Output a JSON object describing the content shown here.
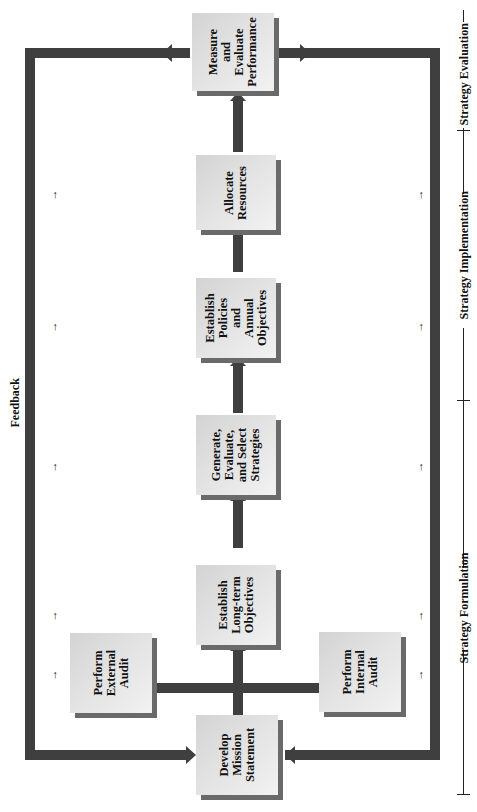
{
  "diagram": {
    "orientation": "rotated-90-ccw",
    "feedback_label": "Feedback",
    "boxes": [
      {
        "id": "develop-mission",
        "label": "Develop\nMission\nStatement"
      },
      {
        "id": "external-audit",
        "label": "Perform\nExternal\nAudit"
      },
      {
        "id": "internal-audit",
        "label": "Perform\nInternal\nAudit"
      },
      {
        "id": "long-term-objectives",
        "label": "Establish\nLong-term\nObjectives"
      },
      {
        "id": "generate-strategies",
        "label": "Generate,\nEvaluate,\nand Select\nStrategies"
      },
      {
        "id": "policies-objectives",
        "label": "Establish\nPolicies\nand\nAnnual\nObjectives"
      },
      {
        "id": "allocate-resources",
        "label": "Allocate\nResources"
      },
      {
        "id": "measure-performance",
        "label": "Measure\nand\nEvaluate\nPerformance"
      }
    ],
    "phases": [
      {
        "id": "formulation",
        "label": "Strategy Formulation"
      },
      {
        "id": "implementation",
        "label": "Strategy Implementation"
      },
      {
        "id": "evaluation",
        "label": "Strategy Evaluation"
      }
    ],
    "small_arrow_glyph": "→",
    "colors": {
      "connector": "#3f3f3f",
      "box_fill": "#e0e0e0",
      "box_shadow": "#6a6a6a",
      "text": "#111111"
    }
  }
}
